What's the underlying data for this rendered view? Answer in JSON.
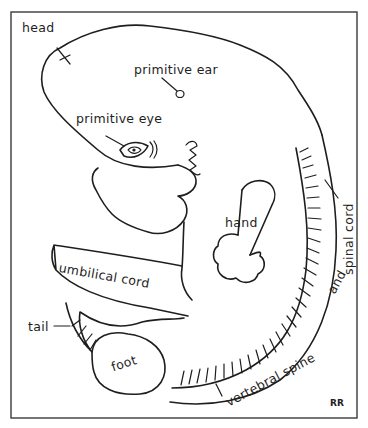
{
  "diagram": {
    "labels": {
      "head": "head",
      "primitive_ear": "primitive ear",
      "primitive_eye": "primitive eye",
      "hand": "hand",
      "umbilical_cord": "umbilical cord",
      "tail": "tail",
      "foot": "foot",
      "vertebral_spine": "vertebral spine",
      "and": "and",
      "spinal_cord": "spinal cord"
    },
    "signature": "RR"
  },
  "colors": {
    "ink": "#1e1e1e",
    "frame": "#3a3a3a",
    "background": "#ffffff"
  }
}
